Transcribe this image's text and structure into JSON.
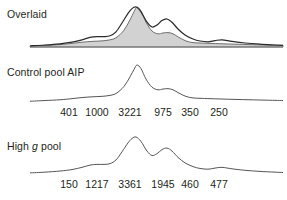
{
  "figure": {
    "panels": [
      {
        "id": "overlaid",
        "label": "Overlaid",
        "ticks": []
      },
      {
        "id": "control",
        "label": "Control pool AIP",
        "ticks": [
          "401",
          "1000",
          "3221",
          "975",
          "350",
          "250"
        ]
      },
      {
        "id": "highg",
        "label_prefix": "High ",
        "label_italic": "g",
        "label_suffix": " pool",
        "label": "High g pool",
        "ticks": [
          "150",
          "1217",
          "3361",
          "1945",
          "460",
          "477"
        ]
      }
    ]
  },
  "colors": {
    "fill": "#d2d2d2",
    "fill_stroke": "#6e6e6e",
    "line_dark": "#2a2a2a",
    "line_thin": "#555555",
    "text": "#231f20",
    "background": "#ffffff"
  },
  "chart_data": {
    "type": "line",
    "title": "",
    "subtitle": "",
    "xlabel": "",
    "ylabel": "",
    "grid": false,
    "legend_position": "none",
    "tick_positions_px": [
      69,
      97,
      130,
      163,
      190,
      219
    ],
    "xlim": [
      30,
      283
    ],
    "ylim": [
      0,
      1
    ],
    "series": [
      {
        "name": "Control pool AIP",
        "style": "filled-area",
        "tick_labels": [
          "401",
          "1000",
          "3221",
          "975",
          "350",
          "250"
        ],
        "peak_values": [
          401,
          1000,
          3221,
          975,
          350,
          250
        ],
        "x": [
          30,
          45,
          60,
          72,
          82,
          92,
          100,
          108,
          116,
          124,
          130,
          134,
          137,
          141,
          146,
          152,
          158,
          163,
          168,
          173,
          179,
          186,
          193,
          200,
          210,
          222,
          235,
          250,
          265,
          283
        ],
        "y": [
          0.02,
          0.04,
          0.06,
          0.09,
          0.12,
          0.14,
          0.15,
          0.17,
          0.23,
          0.42,
          0.68,
          0.88,
          1.0,
          0.9,
          0.62,
          0.4,
          0.33,
          0.35,
          0.36,
          0.33,
          0.24,
          0.15,
          0.11,
          0.1,
          0.09,
          0.08,
          0.07,
          0.06,
          0.05,
          0.04
        ]
      },
      {
        "name": "High g pool",
        "style": "line",
        "tick_labels": [
          "150",
          "1217",
          "3361",
          "1945",
          "460",
          "477"
        ],
        "peak_values": [
          150,
          1217,
          3361,
          1945,
          460,
          477
        ],
        "x": [
          30,
          45,
          60,
          72,
          82,
          90,
          97,
          104,
          110,
          116,
          122,
          128,
          132,
          136,
          141,
          147,
          152,
          157,
          162,
          167,
          172,
          178,
          185,
          193,
          200,
          208,
          215,
          222,
          232,
          245,
          260,
          275,
          283
        ],
        "y": [
          0.03,
          0.05,
          0.08,
          0.12,
          0.18,
          0.24,
          0.26,
          0.26,
          0.28,
          0.38,
          0.6,
          0.84,
          0.96,
          1.0,
          0.88,
          0.62,
          0.5,
          0.55,
          0.66,
          0.7,
          0.62,
          0.45,
          0.3,
          0.2,
          0.15,
          0.13,
          0.16,
          0.18,
          0.14,
          0.1,
          0.07,
          0.05,
          0.04
        ]
      }
    ]
  }
}
